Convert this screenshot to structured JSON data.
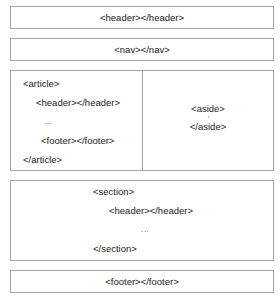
{
  "diagram": {
    "colors": {
      "border": "#a6a6a6",
      "text": "#222222",
      "background": "#ffffff"
    },
    "header": {
      "label": "<header></header>"
    },
    "nav": {
      "label": "<nav></nav>"
    },
    "article": {
      "open": "<article>",
      "header": "<header></header>",
      "ellipsis": "...",
      "footer": "<footer></footer>",
      "close": "</article>"
    },
    "aside": {
      "open": "<aside>",
      "close": "</aside>"
    },
    "section": {
      "open": "<section>",
      "header": "<header></header>",
      "ellipsis": "...",
      "close": "</section>"
    },
    "footer": {
      "label": "<footer></footer>"
    }
  }
}
